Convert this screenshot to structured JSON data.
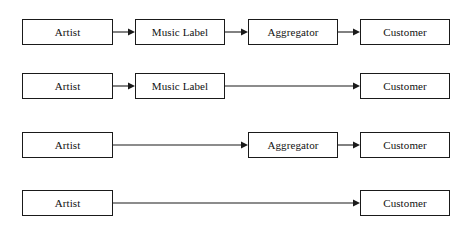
{
  "diagram": {
    "type": "flow-diagram",
    "background_color": "#ffffff",
    "line_color": "#1a1a1a",
    "text_color": "#111111",
    "node_labels": {
      "artist": "Artist",
      "music_label": "Music Label",
      "aggregator": "Aggregator",
      "customer": "Customer"
    },
    "columns": [
      {
        "key": "artist",
        "x": 22,
        "width": 91
      },
      {
        "key": "music_label",
        "x": 135,
        "width": 90
      },
      {
        "key": "aggregator",
        "x": 248,
        "width": 90
      },
      {
        "key": "customer",
        "x": 360,
        "width": 90
      }
    ],
    "rows": [
      {
        "name": "row-full-chain",
        "y": 19,
        "nodes": [
          {
            "label": "Artist",
            "column": "artist"
          },
          {
            "label": "Music Label",
            "column": "music_label"
          },
          {
            "label": "Aggregator",
            "column": "aggregator"
          },
          {
            "label": "Customer",
            "column": "customer"
          }
        ],
        "arrows": [
          {
            "from_x": 113,
            "to_x": 135
          },
          {
            "from_x": 225,
            "to_x": 248
          },
          {
            "from_x": 338,
            "to_x": 360
          }
        ]
      },
      {
        "name": "row-no-aggregator",
        "y": 73,
        "nodes": [
          {
            "label": "Artist",
            "column": "artist"
          },
          {
            "label": "Music Label",
            "column": "music_label"
          },
          {
            "label": "Customer",
            "column": "customer"
          }
        ],
        "arrows": [
          {
            "from_x": 113,
            "to_x": 135
          },
          {
            "from_x": 225,
            "to_x": 360
          }
        ]
      },
      {
        "name": "row-no-music-label",
        "y": 132,
        "nodes": [
          {
            "label": "Artist",
            "column": "artist"
          },
          {
            "label": "Aggregator",
            "column": "aggregator"
          },
          {
            "label": "Customer",
            "column": "customer"
          }
        ],
        "arrows": [
          {
            "from_x": 113,
            "to_x": 248
          },
          {
            "from_x": 338,
            "to_x": 360
          }
        ]
      },
      {
        "name": "row-direct",
        "y": 190,
        "nodes": [
          {
            "label": "Artist",
            "column": "artist"
          },
          {
            "label": "Customer",
            "column": "customer"
          }
        ],
        "arrows": [
          {
            "from_x": 113,
            "to_x": 360
          }
        ]
      }
    ]
  }
}
